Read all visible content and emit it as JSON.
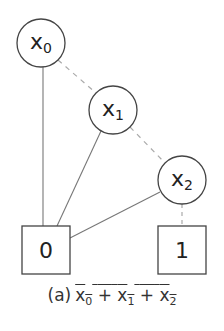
{
  "diagram": {
    "type": "binary-decision-diagram",
    "nodes": [
      {
        "id": "x0",
        "label": "x",
        "sub": "0",
        "shape": "circle",
        "cx": 41,
        "cy": 43,
        "r": 24
      },
      {
        "id": "x1",
        "label": "x",
        "sub": "1",
        "shape": "circle",
        "cx": 113,
        "cy": 110,
        "r": 24
      },
      {
        "id": "x2",
        "label": "x",
        "sub": "2",
        "shape": "circle",
        "cx": 182,
        "cy": 180,
        "r": 24
      }
    ],
    "terminals": [
      {
        "id": "t0",
        "label": "0",
        "shape": "square",
        "x": 22,
        "y": 226,
        "size": 48
      },
      {
        "id": "t1",
        "label": "1",
        "shape": "square",
        "x": 158,
        "y": 226,
        "size": 48
      }
    ],
    "edges": [
      {
        "from": "x0",
        "to": "x1",
        "style": "dashed",
        "meaning": "low"
      },
      {
        "from": "x0",
        "to": "0",
        "style": "solid",
        "meaning": "high"
      },
      {
        "from": "x1",
        "to": "x2",
        "style": "dashed",
        "meaning": "low"
      },
      {
        "from": "x1",
        "to": "0",
        "style": "solid",
        "meaning": "high"
      },
      {
        "from": "x2",
        "to": "1",
        "style": "dashed",
        "meaning": "low"
      },
      {
        "from": "x2",
        "to": "0",
        "style": "solid",
        "meaning": "high"
      }
    ],
    "colors": {
      "node_stroke": "#444444",
      "edge_solid": "#777777",
      "edge_dashed": "#aaaaaa",
      "text": "#222222"
    }
  },
  "caption": {
    "prefix": "(a)",
    "expression": "x0 + x1 + x2",
    "terms": [
      {
        "var": "x",
        "sub": "0"
      },
      {
        "op": "+"
      },
      {
        "var": "x",
        "sub": "1"
      },
      {
        "op": "+"
      },
      {
        "var": "x",
        "sub": "2"
      }
    ],
    "overlined": true
  }
}
